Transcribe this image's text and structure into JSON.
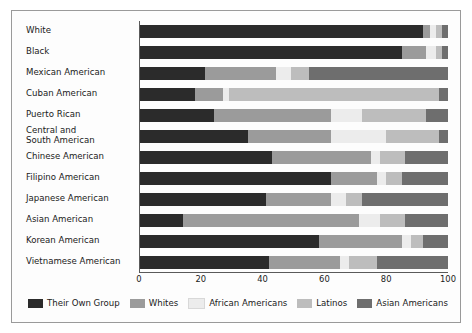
{
  "chart_data": {
    "type": "bar",
    "subtype": "horizontal-stacked-100",
    "title": "",
    "xlabel": "",
    "ylabel": "",
    "xlim": [
      0,
      100
    ],
    "xticks": [
      0,
      20,
      40,
      60,
      80,
      100
    ],
    "grid": false,
    "legend_position": "bottom",
    "categories": [
      "White",
      "Black",
      "Mexican American",
      "Cuban American",
      "Puerto Rican",
      "Central and\nSouth American",
      "Chinese American",
      "Filipino American",
      "Japanese American",
      "Asian American",
      "Korean American",
      "Vietnamese American"
    ],
    "series": [
      {
        "name": "Their Own Group",
        "color": "#2b2b2b",
        "values": [
          92,
          85,
          21,
          18,
          24,
          35,
          43,
          62,
          41,
          14,
          58,
          42
        ]
      },
      {
        "name": "Whites",
        "color": "#9b9b9b",
        "values": [
          2,
          8,
          23,
          9,
          38,
          27,
          32,
          15,
          21,
          57,
          27,
          23
        ]
      },
      {
        "name": "African Americans",
        "color": "#ececec",
        "values": [
          2,
          3,
          5,
          2,
          10,
          18,
          3,
          3,
          5,
          7,
          3,
          3
        ]
      },
      {
        "name": "Latinos",
        "color": "#bdbdbd",
        "values": [
          2,
          2,
          6,
          68,
          21,
          17,
          8,
          5,
          5,
          8,
          4,
          9
        ]
      },
      {
        "name": "Asian Americans",
        "color": "#6e6e6e",
        "values": [
          2,
          2,
          45,
          3,
          7,
          3,
          14,
          15,
          28,
          14,
          8,
          23
        ]
      }
    ]
  },
  "legend": {
    "items": [
      {
        "label": "Their Own Group",
        "color": "#2b2b2b"
      },
      {
        "label": "Whites",
        "color": "#9b9b9b"
      },
      {
        "label": "African Americans",
        "color": "#ececec"
      },
      {
        "label": "Latinos",
        "color": "#bdbdbd"
      },
      {
        "label": "Asian Americans",
        "color": "#6e6e6e"
      }
    ]
  }
}
